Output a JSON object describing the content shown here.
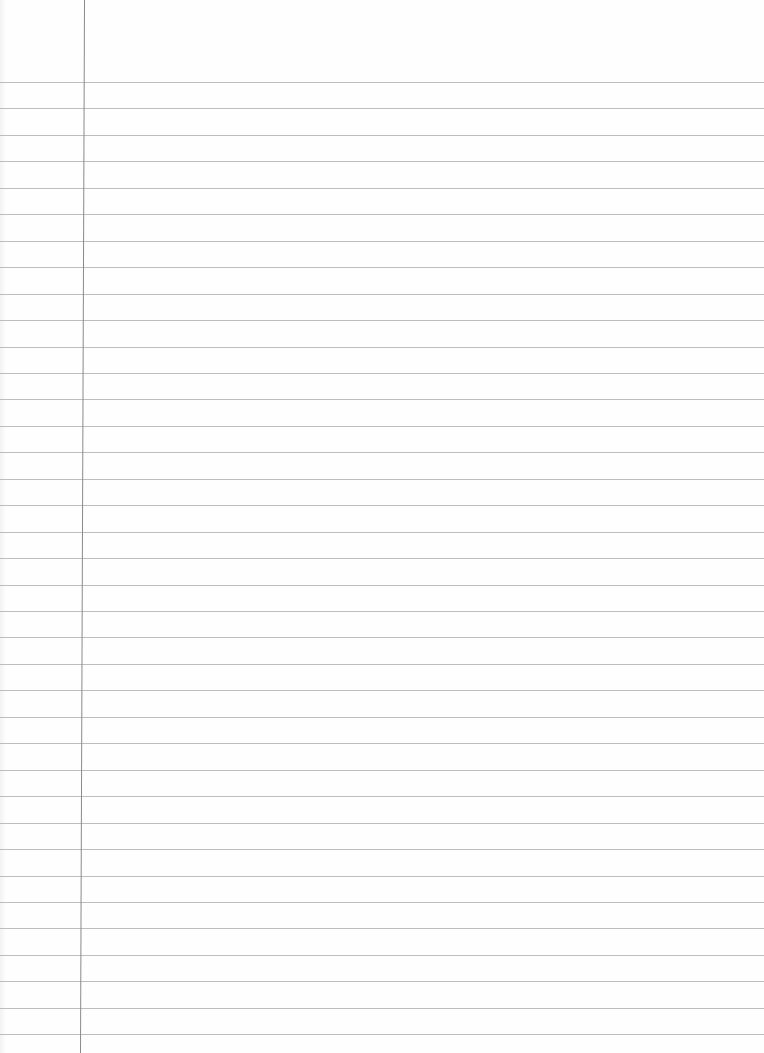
{
  "page": {
    "type": "lined-paper",
    "width": 764,
    "height": 1053,
    "background_color": "#fefefe"
  },
  "rules": {
    "count": 37,
    "first_y": 82,
    "spacing": 26.45,
    "color": "#b9b9b9"
  },
  "margin": {
    "x_top": 84,
    "x_bottom": 80,
    "color": "#8a8a8a"
  },
  "content": {
    "text": ""
  }
}
